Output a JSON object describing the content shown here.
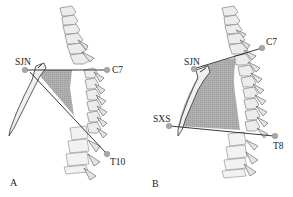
{
  "figure": {
    "panels": [
      {
        "id": "A",
        "label": "A",
        "landmarks": {
          "sjn": "SJN",
          "c7": "C7",
          "t10": "T10"
        },
        "region_color": "#a9a9a9"
      },
      {
        "id": "B",
        "label": "B",
        "landmarks": {
          "sjn": "SJN",
          "c7": "C7",
          "sxs": "SXS",
          "t8": "T8"
        },
        "region_color": "#a9a9a9"
      }
    ]
  }
}
